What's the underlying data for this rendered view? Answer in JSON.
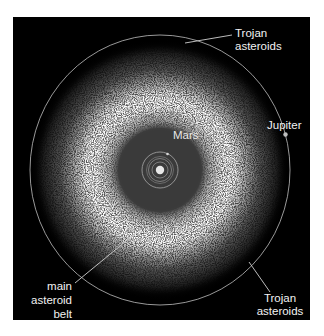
{
  "figure": {
    "background_color": "#000000",
    "page_color": "#ffffff",
    "sun": {
      "label": "",
      "color": "#e6e6e6"
    },
    "planets": {
      "mars": {
        "label": "Mars",
        "color": "#d8d8d8"
      },
      "jupiter": {
        "label": "Jupiter",
        "color": "#bdbdbd"
      }
    },
    "labels": {
      "trojan_top": {
        "line1": "Trojan",
        "line2": "asteroids"
      },
      "trojan_bottom": {
        "line1": "Trojan",
        "line2": "asteroids"
      },
      "main_belt": {
        "line1": "main",
        "line2": "asteroid",
        "line3": "belt"
      },
      "mars": "Mars",
      "jupiter": "Jupiter"
    }
  }
}
